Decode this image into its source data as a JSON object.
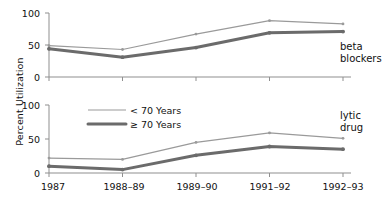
{
  "chart_data": [
    {
      "type": "line",
      "panel": "beta blockers",
      "title": "",
      "xlabel": "",
      "ylabel": "Percent Utilization",
      "categories": [
        "1987",
        "1988–89",
        "1989–90",
        "1991–92",
        "1992–93"
      ],
      "ylim": [
        0,
        100
      ],
      "yticks": [
        0,
        50,
        100
      ],
      "grid": false,
      "legend_position": "lower-panel-upper-left",
      "series": [
        {
          "name": "< 70 Years",
          "values": [
            49,
            43,
            67,
            88,
            83
          ],
          "color": "#9a9a9a",
          "width": 1.2
        },
        {
          "name": "≥ 70 Years",
          "values": [
            44,
            31,
            46,
            69,
            71
          ],
          "color": "#6b6b6b",
          "width": 3.0
        }
      ]
    },
    {
      "type": "line",
      "panel": "lytic drug",
      "title": "",
      "xlabel": "",
      "ylabel": "Percent Utilization",
      "categories": [
        "1987",
        "1988–89",
        "1989–90",
        "1991–92",
        "1992–93"
      ],
      "ylim": [
        0,
        100
      ],
      "yticks": [
        0,
        50,
        100
      ],
      "grid": false,
      "legend_position": "upper-left",
      "series": [
        {
          "name": "< 70 Years",
          "values": [
            22,
            20,
            45,
            59,
            51
          ],
          "color": "#9a9a9a",
          "width": 1.2
        },
        {
          "name": "≥ 70 Years",
          "values": [
            10,
            5,
            26,
            39,
            35
          ],
          "color": "#6b6b6b",
          "width": 3.0
        }
      ]
    }
  ],
  "axis": {
    "y_title": "Percent Utilization",
    "y_ticks_top": [
      "100",
      "50",
      "0"
    ],
    "y_ticks_bottom": [
      "100",
      "50",
      "0"
    ],
    "x_ticks": [
      "1987",
      "1988–89",
      "1989–90",
      "1991–92",
      "1992–93"
    ]
  },
  "panels": {
    "top_label_line1": "beta",
    "top_label_line2": "blockers",
    "bottom_label_line1": "lytic",
    "bottom_label_line2": "drug"
  },
  "legend": {
    "entry_under_70": "< 70 Years",
    "entry_over_70": "≥ 70 Years"
  },
  "colors": {
    "series_under_70": "#9a9a9a",
    "series_over_70": "#6b6b6b",
    "axis": "#8f8f8f",
    "text": "#111111",
    "background": "#ffffff"
  }
}
